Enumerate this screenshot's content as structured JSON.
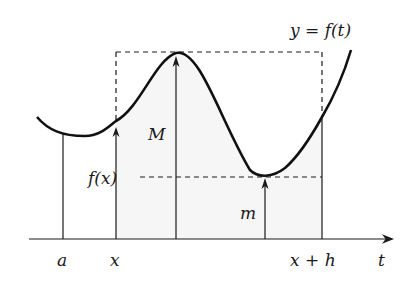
{
  "diagram": {
    "curve_label": "y = f(t)",
    "axis_label": "t",
    "tick_labels": [
      "a",
      "x",
      "x + h"
    ],
    "max_label": "M",
    "min_label": "m",
    "fx_label": "f(x)",
    "colors": {
      "ink": "#1a1a1a",
      "shade": "#f4f4f4"
    }
  }
}
